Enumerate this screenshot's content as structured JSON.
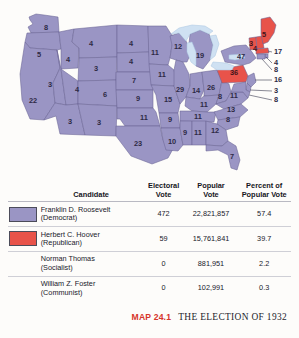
{
  "caption": {
    "map_number": "MAP 24.1",
    "map_title": "THE ELECTION OF 1932"
  },
  "legend": {
    "headers": {
      "candidate": "Candidate",
      "electoral_vote_l1": "Electoral",
      "electoral_vote_l2": "Vote",
      "popular_vote_l1": "Popular",
      "popular_vote_l2": "Vote",
      "percent_l1": "Percent of",
      "percent_l2": "Popular Vote"
    },
    "rows": [
      {
        "name": "Franklin D. Roosevelt",
        "party": "(Democrat)",
        "electoral_vote": "472",
        "popular_vote": "22,821,857",
        "percent": "57.4",
        "swatch": "democrat-swatch",
        "color": "#9a95c4"
      },
      {
        "name": "Herbert C. Hoover",
        "party": "(Republican)",
        "electoral_vote": "59",
        "popular_vote": "15,761,841",
        "percent": "39.7",
        "swatch": "republican-swatch",
        "color": "#e8534a"
      },
      {
        "name": "Norman Thomas",
        "party": "(Socialist)",
        "electoral_vote": "0",
        "popular_vote": "881,951",
        "percent": "2.2",
        "swatch": "",
        "color": ""
      },
      {
        "name": "William Z. Foster",
        "party": "(Communist)",
        "electoral_vote": "0",
        "popular_vote": "102,991",
        "percent": "0.3",
        "swatch": "",
        "color": ""
      }
    ]
  },
  "map": {
    "colors": {
      "democrat": "#9a95c4",
      "republican": "#e8534a",
      "lake": "#cfe1f2",
      "border": "#6b6594",
      "background": "#fdfcfa"
    },
    "state_labels": [
      {
        "state": "WA",
        "value": "8",
        "x": 46,
        "y": 28
      },
      {
        "state": "OR",
        "value": "5",
        "x": 39,
        "y": 55
      },
      {
        "state": "ID",
        "value": "4",
        "x": 68,
        "y": 60
      },
      {
        "state": "MT",
        "value": "4",
        "x": 91,
        "y": 44
      },
      {
        "state": "ND",
        "value": "4",
        "x": 131,
        "y": 44
      },
      {
        "state": "SD",
        "value": "4",
        "x": 131,
        "y": 62
      },
      {
        "state": "WY",
        "value": "3",
        "x": 96,
        "y": 69
      },
      {
        "state": "NV",
        "value": "3",
        "x": 50,
        "y": 85
      },
      {
        "state": "UT",
        "value": "4",
        "x": 77,
        "y": 90
      },
      {
        "state": "CO",
        "value": "6",
        "x": 105,
        "y": 95
      },
      {
        "state": "CA",
        "value": "22",
        "x": 33,
        "y": 101
      },
      {
        "state": "AZ",
        "value": "3",
        "x": 70,
        "y": 122
      },
      {
        "state": "NM",
        "value": "3",
        "x": 99,
        "y": 123
      },
      {
        "state": "NE",
        "value": "7",
        "x": 134,
        "y": 81
      },
      {
        "state": "KS",
        "value": "9",
        "x": 138,
        "y": 99
      },
      {
        "state": "OK",
        "value": "11",
        "x": 144,
        "y": 118
      },
      {
        "state": "TX",
        "value": "23",
        "x": 138,
        "y": 144
      },
      {
        "state": "MN",
        "value": "11",
        "x": 155,
        "y": 53
      },
      {
        "state": "IA",
        "value": "11",
        "x": 162,
        "y": 75
      },
      {
        "state": "MO",
        "value": "15",
        "x": 168,
        "y": 100
      },
      {
        "state": "AR",
        "value": "9",
        "x": 170,
        "y": 120
      },
      {
        "state": "LA",
        "value": "10",
        "x": 172,
        "y": 142
      },
      {
        "state": "WI",
        "value": "12",
        "x": 178,
        "y": 47
      },
      {
        "state": "IL",
        "value": "29",
        "x": 180,
        "y": 90
      },
      {
        "state": "MI",
        "value": "19",
        "x": 200,
        "y": 56
      },
      {
        "state": "IN",
        "value": "14",
        "x": 196,
        "y": 91
      },
      {
        "state": "OH",
        "value": "26",
        "x": 211,
        "y": 88
      },
      {
        "state": "KY",
        "value": "11",
        "x": 204,
        "y": 105
      },
      {
        "state": "TN",
        "value": "11",
        "x": 198,
        "y": 117
      },
      {
        "state": "MS",
        "value": "9",
        "x": 185,
        "y": 133
      },
      {
        "state": "AL",
        "value": "11",
        "x": 198,
        "y": 133
      },
      {
        "state": "GA",
        "value": "12",
        "x": 215,
        "y": 131
      },
      {
        "state": "FL",
        "value": "7",
        "x": 232,
        "y": 157
      },
      {
        "state": "SC",
        "value": "8",
        "x": 228,
        "y": 120
      },
      {
        "state": "NC",
        "value": "13",
        "x": 231,
        "y": 110
      },
      {
        "state": "VA",
        "value": "11",
        "x": 234,
        "y": 96
      },
      {
        "state": "WV",
        "value": "8",
        "x": 220,
        "y": 97
      },
      {
        "state": "PA",
        "value": "36",
        "x": 234,
        "y": 73,
        "on_red": true
      },
      {
        "state": "NY",
        "value": "47",
        "x": 241,
        "y": 57
      },
      {
        "state": "VT",
        "value": "4",
        "x": 255,
        "y": 49,
        "on_red": true
      },
      {
        "state": "NH",
        "value": "3",
        "x": 251,
        "y": 44,
        "on_red": true
      },
      {
        "state": "ME",
        "value": "5",
        "x": 264,
        "y": 35,
        "on_red": true
      }
    ],
    "callouts": [
      {
        "state": "MA",
        "value": "17",
        "x": 274,
        "y": 52
      },
      {
        "state": "RI",
        "value": "4",
        "x": 274,
        "y": 63
      },
      {
        "state": "CT",
        "value": "8",
        "x": 274,
        "y": 70
      },
      {
        "state": "NJ",
        "value": "16",
        "x": 274,
        "y": 80
      },
      {
        "state": "DE",
        "value": "3",
        "x": 274,
        "y": 91
      },
      {
        "state": "MD",
        "value": "8",
        "x": 274,
        "y": 100
      }
    ]
  }
}
